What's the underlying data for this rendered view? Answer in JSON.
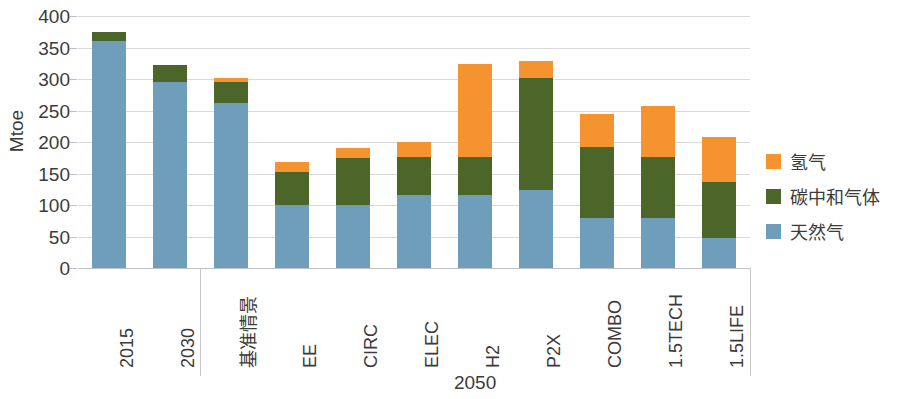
{
  "chart_data": {
    "type": "bar",
    "stacked": true,
    "title": "",
    "xlabel": "2050",
    "ylabel": "Mtoe",
    "ylim": [
      0,
      400
    ],
    "ytick_values": [
      400,
      350,
      300,
      250,
      200,
      150,
      100,
      50,
      0
    ],
    "ytick_labels": [
      "400",
      "350",
      "300",
      "250",
      "200",
      "150",
      "100",
      "50",
      "0"
    ],
    "grid": true,
    "legend_position": "right",
    "categories": [
      "2015",
      "2030",
      "基准情景",
      "EE",
      "CIRC",
      "ELEC",
      "H2",
      "P2X",
      "COMBO",
      "1.5TECH",
      "1.5LIFE"
    ],
    "group_labels": [
      {
        "label": "2050",
        "start_index": 2,
        "end_index": 10
      }
    ],
    "series": [
      {
        "name": "天然气",
        "color": "#6e9eba",
        "values": [
          360,
          295,
          262,
          100,
          100,
          116,
          116,
          124,
          79,
          79,
          48
        ]
      },
      {
        "name": "碳中和气体",
        "color": "#4c6629",
        "values": [
          14,
          27,
          33,
          53,
          75,
          60,
          60,
          178,
          113,
          97,
          89
        ]
      },
      {
        "name": "氢气",
        "color": "#f59331",
        "values": [
          0,
          0,
          6,
          15,
          16,
          24,
          148,
          26,
          52,
          81,
          71
        ]
      }
    ],
    "totals": [
      374,
      322,
      301,
      168,
      191,
      200,
      324,
      328,
      244,
      257,
      208
    ]
  },
  "legend": {
    "items": [
      {
        "label": "氢气",
        "color": "#f59331"
      },
      {
        "label": "碳中和气体",
        "color": "#4c6629"
      },
      {
        "label": "天然气",
        "color": "#6e9eba"
      }
    ]
  }
}
